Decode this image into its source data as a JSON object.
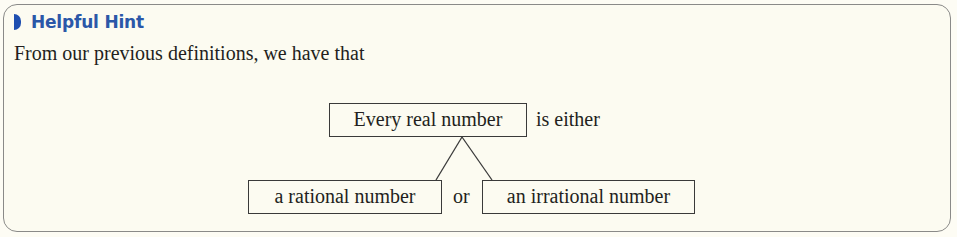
{
  "hint": {
    "title": "Helpful Hint",
    "icon": "half-circle-bullet-icon",
    "accent_color": "#2b57a8"
  },
  "intro_text": "From our previous definitions, we have that",
  "diagram": {
    "root": {
      "label": "Every real number",
      "suffix": "is either"
    },
    "children": [
      {
        "label": "a rational number"
      },
      {
        "label": "an irrational number"
      }
    ],
    "connector_word": "or"
  }
}
